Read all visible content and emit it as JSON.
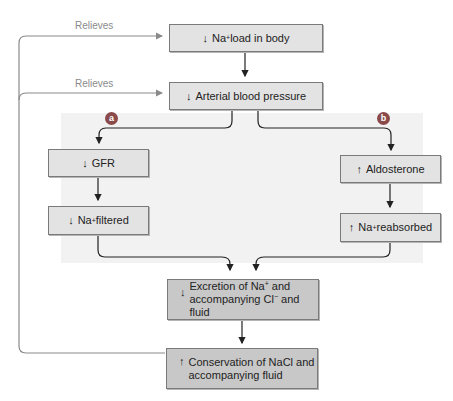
{
  "diagram": {
    "feedback_label_1": "Relieves",
    "feedback_label_2": "Relieves",
    "badges": {
      "a": "a",
      "b": "b"
    },
    "boxes": {
      "na_load": {
        "arrow": "↓",
        "text_pre": "Na",
        "sup": "+",
        "text_post": " load in body"
      },
      "arterial_bp": {
        "arrow": "↓",
        "text": "Arterial blood pressure"
      },
      "gfr": {
        "arrow": "↓",
        "text": "GFR"
      },
      "na_filtered": {
        "arrow": "↓",
        "text_pre": "Na",
        "sup": "+",
        "text_post": " filtered"
      },
      "aldosterone": {
        "arrow": "↑",
        "text": "Aldosterone"
      },
      "na_reabsorbed": {
        "arrow": "↑",
        "text_pre": "Na",
        "sup": "+",
        "text_post": " reabsorbed"
      },
      "excretion": {
        "arrow": "↓",
        "line1_pre": "Excretion of Na",
        "line1_sup": "+",
        "line1_post": " and",
        "line2_pre": "accompanying Cl",
        "line2_sup": "−",
        "line2_post": " and fluid"
      },
      "conservation": {
        "arrow": "↑",
        "line1": "Conservation of NaCl and",
        "line2": "accompanying fluid"
      }
    },
    "colors": {
      "box_light": "#e3e3e3",
      "box_dark": "#c8c8c8",
      "panel": "#f2f2f2",
      "badge": "#8a4a4a",
      "feedback_line": "#8a8a8a",
      "arrow_line": "#222222"
    }
  }
}
